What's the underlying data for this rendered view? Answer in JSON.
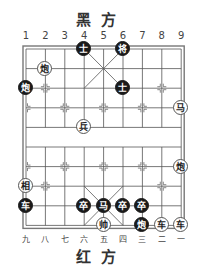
{
  "top_label": "黑方",
  "bottom_label": "红方",
  "top_columns": [
    "1",
    "2",
    "3",
    "4",
    "5",
    "6",
    "7",
    "8",
    "9"
  ],
  "bottom_columns": [
    "九",
    "八",
    "七",
    "六",
    "五",
    "四",
    "三",
    "二",
    "一"
  ],
  "pieces": [
    {
      "side": "black",
      "char": "士",
      "col": 4,
      "row": 0
    },
    {
      "side": "black",
      "char": "将",
      "col": 6,
      "row": 0
    },
    {
      "side": "red",
      "char": "炮",
      "col": 2,
      "row": 1
    },
    {
      "side": "black",
      "char": "炮",
      "col": 1,
      "row": 2
    },
    {
      "side": "black",
      "char": "士",
      "col": 6,
      "row": 2
    },
    {
      "side": "red",
      "char": "马",
      "col": 9,
      "row": 3
    },
    {
      "side": "red",
      "char": "兵",
      "col": 4,
      "row": 4
    },
    {
      "side": "red",
      "char": "炮",
      "col": 9,
      "row": 6
    },
    {
      "side": "red",
      "char": "相",
      "col": 1,
      "row": 7
    },
    {
      "side": "black",
      "char": "车",
      "col": 1,
      "row": 8
    },
    {
      "side": "black",
      "char": "卒",
      "col": 4,
      "row": 8
    },
    {
      "side": "black",
      "char": "马",
      "col": 5,
      "row": 8
    },
    {
      "side": "black",
      "char": "卒",
      "col": 6,
      "row": 8
    },
    {
      "side": "black",
      "char": "卒",
      "col": 7,
      "row": 8
    },
    {
      "side": "red",
      "char": "帅",
      "col": 5,
      "row": 9
    },
    {
      "side": "black",
      "char": "炮",
      "col": 7,
      "row": 9
    },
    {
      "side": "red",
      "char": "车",
      "col": 8,
      "row": 9
    },
    {
      "side": "red",
      "char": "车",
      "col": 9,
      "row": 9
    }
  ]
}
